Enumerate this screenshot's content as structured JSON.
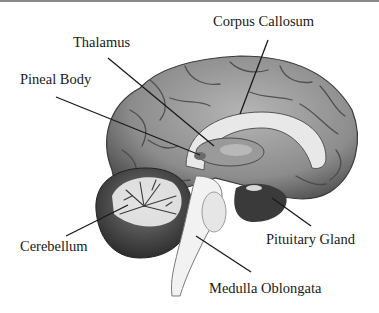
{
  "diagram": {
    "labels": [
      {
        "id": "corpus-callosum",
        "text": "Corpus Callosum"
      },
      {
        "id": "thalamus",
        "text": "Thalamus"
      },
      {
        "id": "pineal-body",
        "text": "Pineal Body"
      },
      {
        "id": "cerebellum",
        "text": "Cerebellum"
      },
      {
        "id": "pituitary-gland",
        "text": "Pituitary Gland"
      },
      {
        "id": "medulla-oblongata",
        "text": "Medulla Oblongata"
      }
    ],
    "colors": {
      "line": "#1a1a1a",
      "cortex": "#8c8c8c",
      "cortex_dark": "#4a4a4a",
      "white_matter": "#e6e6e6",
      "cerebellum": "#5a5a5a",
      "background": "#ffffff"
    }
  }
}
